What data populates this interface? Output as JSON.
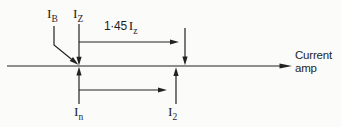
{
  "colors": {
    "ink": "#222222",
    "background": "#fbfbf9"
  },
  "axis": {
    "label_line1": "Current",
    "label_line2": "amp"
  },
  "labels": {
    "ib": {
      "main": "I",
      "sub": "B"
    },
    "iz": {
      "main": "I",
      "sub": "Z"
    },
    "iz145": {
      "prefix": "1·45",
      "main": "I",
      "sub": "z"
    },
    "in": {
      "main": "I",
      "sub": "n"
    },
    "i2": {
      "main": "I",
      "sub": "2"
    }
  }
}
